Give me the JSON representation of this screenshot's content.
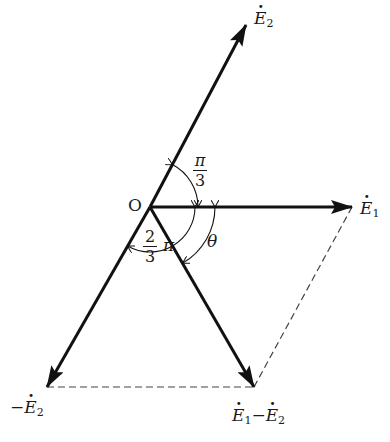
{
  "diagram": {
    "type": "phasor-diagram",
    "origin_label": "O",
    "vectors": [
      {
        "id": "E1",
        "label": "E",
        "subscript": "1",
        "prefix": "",
        "dotted": true,
        "from": [
          150,
          207
        ],
        "to": [
          352,
          207
        ],
        "style": "solid-arrow"
      },
      {
        "id": "E2",
        "label": "E",
        "subscript": "2",
        "prefix": "",
        "dotted": true,
        "from": [
          150,
          207
        ],
        "to": [
          246,
          25
        ],
        "style": "solid-arrow"
      },
      {
        "id": "negE2",
        "label": "E",
        "subscript": "2",
        "prefix": "−",
        "dotted": true,
        "from": [
          150,
          207
        ],
        "to": [
          47,
          387
        ],
        "style": "solid-arrow"
      },
      {
        "id": "E1minusE2",
        "label": "E₁−E₂",
        "from": [
          150,
          207
        ],
        "to": [
          254,
          387
        ],
        "style": "solid-arrow"
      }
    ],
    "dashed_lines": [
      {
        "from": [
          47,
          387
        ],
        "to": [
          254,
          387
        ]
      },
      {
        "from": [
          254,
          387
        ],
        "to": [
          352,
          207
        ]
      }
    ],
    "angles": [
      {
        "name": "pi-over-3",
        "numerator": "π",
        "denominator": "3",
        "between": [
          "E1",
          "E2"
        ]
      },
      {
        "name": "two-thirds-pi",
        "numerator": "2",
        "denominator": "3",
        "suffix": "π",
        "between": [
          "E1",
          "negE2"
        ]
      },
      {
        "name": "theta",
        "symbol": "θ",
        "between": [
          "E1",
          "E1minusE2"
        ]
      }
    ],
    "labels": {
      "E2_top": {
        "prefix": "",
        "base": "E",
        "sub": "2"
      },
      "E1_right": {
        "prefix": "",
        "base": "E",
        "sub": "1"
      },
      "negE2_bottom": {
        "prefix": "−",
        "base": "E",
        "sub": "2"
      },
      "diff_bottom": {
        "a_base": "E",
        "a_sub": "1",
        "op": "−",
        "b_base": "E",
        "b_sub": "2"
      },
      "origin": "O",
      "theta": "θ",
      "pi3_num": "π",
      "pi3_den": "3",
      "twothird_num": "2",
      "twothird_den": "3",
      "twothird_pi": "π"
    },
    "colors": {
      "stroke": "#111111",
      "dash": "#444444",
      "background": "#ffffff"
    }
  }
}
